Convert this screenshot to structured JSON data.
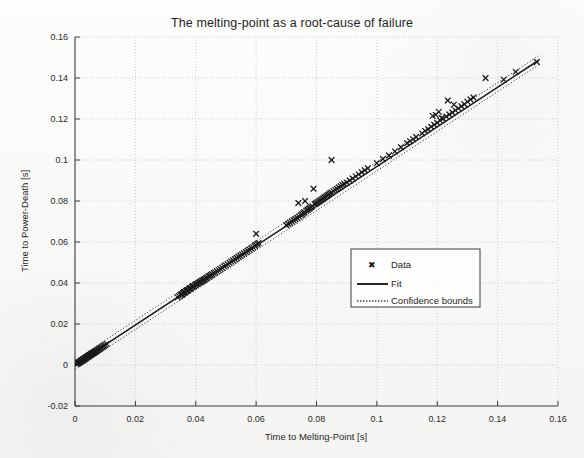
{
  "chart_data": {
    "type": "scatter",
    "title": "The melting-point as a root-cause of failure",
    "xlabel": "Time to Melting-Point [s]",
    "ylabel": "Time to Power-Death [s]",
    "xlim": [
      0,
      0.16
    ],
    "ylim": [
      -0.02,
      0.16
    ],
    "xticks": [
      "0",
      "0.02",
      "0.04",
      "0.06",
      "0.08",
      "0.1",
      "0.12",
      "0.14",
      "0.16"
    ],
    "xtick_values": [
      0,
      0.02,
      0.04,
      0.06,
      0.08,
      0.1,
      0.12,
      0.14,
      0.16
    ],
    "yticks": [
      "-0.02",
      "0",
      "0.02",
      "0.04",
      "0.06",
      "0.08",
      "0.1",
      "0.12",
      "0.14",
      "0.16"
    ],
    "ytick_values": [
      -0.02,
      0,
      0.02,
      0.04,
      0.06,
      0.08,
      0.1,
      0.12,
      0.14,
      0.16
    ],
    "grid": true,
    "grid_style": "dotted",
    "legend_position": "center-right",
    "series": [
      {
        "name": "Data",
        "type": "scatter",
        "marker": "x",
        "color": "#1a1a1a",
        "points": [
          [
            0.0005,
            0.0004
          ],
          [
            0.0008,
            0.0007
          ],
          [
            0.001,
            0.0009
          ],
          [
            0.0012,
            0.0011
          ],
          [
            0.0014,
            0.0012
          ],
          [
            0.0016,
            0.0015
          ],
          [
            0.0017,
            0.0014
          ],
          [
            0.0019,
            0.0018
          ],
          [
            0.002,
            0.0019
          ],
          [
            0.0022,
            0.002
          ],
          [
            0.0023,
            0.0022
          ],
          [
            0.0025,
            0.0024
          ],
          [
            0.0026,
            0.0023
          ],
          [
            0.0028,
            0.0027
          ],
          [
            0.0029,
            0.0028
          ],
          [
            0.0031,
            0.0029
          ],
          [
            0.0032,
            0.0031
          ],
          [
            0.0034,
            0.0033
          ],
          [
            0.0035,
            0.0032
          ],
          [
            0.0037,
            0.0036
          ],
          [
            0.0038,
            0.0037
          ],
          [
            0.004,
            0.0038
          ],
          [
            0.0041,
            0.004
          ],
          [
            0.0043,
            0.0042
          ],
          [
            0.0044,
            0.0043
          ],
          [
            0.0046,
            0.0044
          ],
          [
            0.0047,
            0.0046
          ],
          [
            0.0049,
            0.0048
          ],
          [
            0.005,
            0.0049
          ],
          [
            0.0052,
            0.005
          ],
          [
            0.0053,
            0.0052
          ],
          [
            0.0055,
            0.0054
          ],
          [
            0.0056,
            0.0055
          ],
          [
            0.0058,
            0.0056
          ],
          [
            0.006,
            0.0058
          ],
          [
            0.0062,
            0.006
          ],
          [
            0.0064,
            0.0062
          ],
          [
            0.0066,
            0.0064
          ],
          [
            0.0068,
            0.0066
          ],
          [
            0.007,
            0.0068
          ],
          [
            0.0073,
            0.0071
          ],
          [
            0.0076,
            0.0074
          ],
          [
            0.0079,
            0.0077
          ],
          [
            0.0082,
            0.008
          ],
          [
            0.0085,
            0.0083
          ],
          [
            0.0088,
            0.0086
          ],
          [
            0.0092,
            0.009
          ],
          [
            0.0096,
            0.0094
          ],
          [
            0.01,
            0.0098
          ],
          [
            0.0105,
            0.0103
          ],
          [
            0.034,
            0.033
          ],
          [
            0.0345,
            0.0336
          ],
          [
            0.035,
            0.0341
          ],
          [
            0.0352,
            0.0346
          ],
          [
            0.0355,
            0.0344
          ],
          [
            0.0358,
            0.035
          ],
          [
            0.036,
            0.0352
          ],
          [
            0.0362,
            0.0356
          ],
          [
            0.0365,
            0.0355
          ],
          [
            0.0368,
            0.0361
          ],
          [
            0.037,
            0.0362
          ],
          [
            0.0372,
            0.0366
          ],
          [
            0.0375,
            0.0365
          ],
          [
            0.0378,
            0.0371
          ],
          [
            0.038,
            0.0372
          ],
          [
            0.0382,
            0.0376
          ],
          [
            0.0385,
            0.0375
          ],
          [
            0.0388,
            0.0381
          ],
          [
            0.039,
            0.0382
          ],
          [
            0.0392,
            0.0386
          ],
          [
            0.0395,
            0.0385
          ],
          [
            0.0398,
            0.0391
          ],
          [
            0.04,
            0.0392
          ],
          [
            0.0403,
            0.0396
          ],
          [
            0.0406,
            0.0395
          ],
          [
            0.0409,
            0.0401
          ],
          [
            0.0412,
            0.0402
          ],
          [
            0.0415,
            0.0406
          ],
          [
            0.0418,
            0.0405
          ],
          [
            0.0421,
            0.0411
          ],
          [
            0.0424,
            0.0412
          ],
          [
            0.0427,
            0.0416
          ],
          [
            0.043,
            0.0418
          ],
          [
            0.0434,
            0.0423
          ],
          [
            0.0438,
            0.0426
          ],
          [
            0.0442,
            0.0431
          ],
          [
            0.0446,
            0.0434
          ],
          [
            0.045,
            0.0439
          ],
          [
            0.0455,
            0.0443
          ],
          [
            0.046,
            0.0448
          ],
          [
            0.0465,
            0.0452
          ],
          [
            0.047,
            0.0458
          ],
          [
            0.0476,
            0.0463
          ],
          [
            0.0482,
            0.0469
          ],
          [
            0.0488,
            0.0474
          ],
          [
            0.0494,
            0.0481
          ],
          [
            0.05,
            0.0486
          ],
          [
            0.0506,
            0.0492
          ],
          [
            0.0512,
            0.0498
          ],
          [
            0.0518,
            0.0504
          ],
          [
            0.0524,
            0.051
          ],
          [
            0.053,
            0.0516
          ],
          [
            0.0536,
            0.0522
          ],
          [
            0.0542,
            0.0528
          ],
          [
            0.0548,
            0.0533
          ],
          [
            0.0554,
            0.0539
          ],
          [
            0.056,
            0.0545
          ],
          [
            0.0566,
            0.0551
          ],
          [
            0.0572,
            0.0557
          ],
          [
            0.0578,
            0.0563
          ],
          [
            0.0584,
            0.0568
          ],
          [
            0.059,
            0.0574
          ],
          [
            0.0596,
            0.058
          ],
          [
            0.06,
            0.064
          ],
          [
            0.0598,
            0.0586
          ],
          [
            0.0604,
            0.059
          ],
          [
            0.0608,
            0.0596
          ],
          [
            0.07,
            0.0682
          ],
          [
            0.0706,
            0.0688
          ],
          [
            0.0712,
            0.0694
          ],
          [
            0.0718,
            0.07
          ],
          [
            0.0724,
            0.0706
          ],
          [
            0.073,
            0.0712
          ],
          [
            0.0736,
            0.0718
          ],
          [
            0.0742,
            0.0724
          ],
          [
            0.0748,
            0.073
          ],
          [
            0.0752,
            0.0735
          ],
          [
            0.0756,
            0.074
          ],
          [
            0.076,
            0.0745
          ],
          [
            0.074,
            0.079
          ],
          [
            0.0762,
            0.08
          ],
          [
            0.0766,
            0.0752
          ],
          [
            0.077,
            0.0757
          ],
          [
            0.0774,
            0.0762
          ],
          [
            0.0778,
            0.0766
          ],
          [
            0.0782,
            0.077
          ],
          [
            0.0786,
            0.0775
          ],
          [
            0.079,
            0.086
          ],
          [
            0.0794,
            0.0784
          ],
          [
            0.0798,
            0.0788
          ],
          [
            0.0802,
            0.0792
          ],
          [
            0.0806,
            0.0796
          ],
          [
            0.081,
            0.08
          ],
          [
            0.0814,
            0.0804
          ],
          [
            0.0818,
            0.0808
          ],
          [
            0.0822,
            0.0812
          ],
          [
            0.0826,
            0.0817
          ],
          [
            0.083,
            0.0821
          ],
          [
            0.085,
            0.1
          ],
          [
            0.0834,
            0.0825
          ],
          [
            0.0838,
            0.0829
          ],
          [
            0.0842,
            0.0833
          ],
          [
            0.0846,
            0.0838
          ],
          [
            0.085,
            0.0842
          ],
          [
            0.0856,
            0.0848
          ],
          [
            0.0862,
            0.0854
          ],
          [
            0.0868,
            0.086
          ],
          [
            0.0874,
            0.0866
          ],
          [
            0.088,
            0.0872
          ],
          [
            0.0886,
            0.0878
          ],
          [
            0.0892,
            0.0884
          ],
          [
            0.09,
            0.089
          ],
          [
            0.091,
            0.09
          ],
          [
            0.092,
            0.091
          ],
          [
            0.093,
            0.092
          ],
          [
            0.094,
            0.093
          ],
          [
            0.095,
            0.094
          ],
          [
            0.096,
            0.095
          ],
          [
            0.097,
            0.096
          ],
          [
            0.115,
            0.113
          ],
          [
            0.116,
            0.1142
          ],
          [
            0.117,
            0.115
          ],
          [
            0.118,
            0.1162
          ],
          [
            0.1185,
            0.1215
          ],
          [
            0.119,
            0.1172
          ],
          [
            0.1195,
            0.122
          ],
          [
            0.12,
            0.1182
          ],
          [
            0.1205,
            0.1235
          ],
          [
            0.121,
            0.1192
          ],
          [
            0.1215,
            0.1205
          ],
          [
            0.122,
            0.1202
          ],
          [
            0.123,
            0.1212
          ],
          [
            0.1235,
            0.129
          ],
          [
            0.124,
            0.1222
          ],
          [
            0.125,
            0.1232
          ],
          [
            0.1255,
            0.127
          ],
          [
            0.126,
            0.1242
          ],
          [
            0.127,
            0.1252
          ],
          [
            0.128,
            0.1262
          ],
          [
            0.129,
            0.1272
          ],
          [
            0.13,
            0.1285
          ],
          [
            0.131,
            0.1295
          ],
          [
            0.132,
            0.1305
          ],
          [
            0.136,
            0.14
          ],
          [
            0.142,
            0.1392
          ],
          [
            0.146,
            0.143
          ],
          [
            0.153,
            0.1478
          ],
          [
            0.11,
            0.1082
          ],
          [
            0.111,
            0.1092
          ],
          [
            0.112,
            0.1102
          ],
          [
            0.113,
            0.1112
          ],
          [
            0.1,
            0.0985
          ],
          [
            0.102,
            0.1005
          ],
          [
            0.104,
            0.1022
          ],
          [
            0.106,
            0.1042
          ],
          [
            0.108,
            0.1062
          ]
        ]
      },
      {
        "name": "Fit",
        "type": "line",
        "color": "#1a1a1a",
        "slope": 0.9665,
        "intercept": 0.0002,
        "x_range": [
          0,
          0.1535
        ]
      },
      {
        "name": "Confidence bounds",
        "type": "line",
        "style": "dotted",
        "color": "#3a3a3a",
        "offset": 0.0022
      }
    ]
  },
  "legend": {
    "entries": [
      {
        "label": "Data",
        "marker": "x-marker"
      },
      {
        "label": "Fit",
        "marker": "solid-line"
      },
      {
        "label": "Confidence bounds",
        "marker": "dotted-line"
      }
    ]
  }
}
